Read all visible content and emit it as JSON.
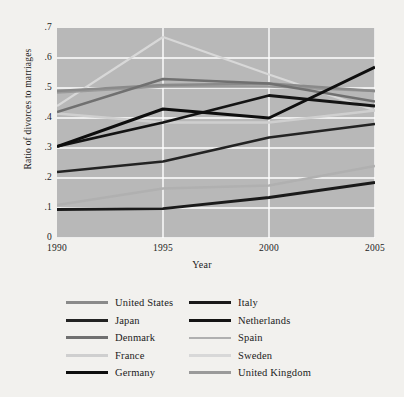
{
  "chart_data": {
    "type": "line",
    "title": "",
    "xlabel": "Year",
    "ylabel": "Ratio of divorces to marriages",
    "x": [
      1990,
      1995,
      2000,
      2005
    ],
    "xticklabels": [
      "1990",
      "1995",
      "2000",
      "2005"
    ],
    "yticklabels": [
      "0",
      ".1",
      ".2",
      ".3",
      ".4",
      ".5",
      ".6",
      ".7"
    ],
    "ytickvalues": [
      0,
      0.1,
      0.2,
      0.3,
      0.4,
      0.5,
      0.6,
      0.7
    ],
    "xlim": [
      1990,
      2005
    ],
    "ylim": [
      0,
      0.7
    ],
    "grid": "white gridlines, horizontal and vertical",
    "legend_position": "below plot, two columns",
    "plot_background": "#b8b8b8",
    "figure_background": "#f2f1ee",
    "gridline_color": "#ffffff",
    "series": [
      {
        "name": "United States",
        "color": "#8a8a8a",
        "width": 2.6,
        "values": [
          0.49,
          0.51,
          0.515,
          0.49
        ]
      },
      {
        "name": "Japan",
        "color": "#232323",
        "width": 2.6,
        "values": [
          0.22,
          0.255,
          0.335,
          0.38
        ]
      },
      {
        "name": "Denmark",
        "color": "#707070",
        "width": 2.6,
        "values": [
          0.42,
          0.53,
          0.515,
          0.455
        ]
      },
      {
        "name": "France",
        "color": "#cfcfcf",
        "width": 2.6,
        "values": [
          0.415,
          0.385,
          0.385,
          0.425
        ]
      },
      {
        "name": "Germany",
        "color": "#0e0e0e",
        "width": 3.0,
        "values": [
          0.305,
          0.43,
          0.4,
          0.57
        ]
      },
      {
        "name": "Italy",
        "color": "#1a1a1a",
        "width": 2.8,
        "values": [
          0.095,
          0.098,
          0.135,
          0.185
        ]
      },
      {
        "name": "Netherlands",
        "color": "#141414",
        "width": 2.8,
        "values": [
          0.305,
          0.385,
          0.475,
          0.44
        ]
      },
      {
        "name": "Spain",
        "color": "#b0b0b0",
        "width": 2.4,
        "values": [
          0.11,
          0.165,
          0.175,
          0.24
        ]
      },
      {
        "name": "Sweden",
        "color": "#d8d8d8",
        "width": 2.2,
        "values": [
          0.44,
          0.67,
          0.545,
          0.425
        ]
      },
      {
        "name": "United Kingdom",
        "color": "#9a9a9a",
        "width": 2.6,
        "values": [
          0.485,
          0.505,
          0.505,
          0.49
        ]
      }
    ]
  },
  "legend": {
    "columns": [
      [
        "United States",
        "Japan",
        "Denmark",
        "France",
        "Germany"
      ],
      [
        "Italy",
        "Netherlands",
        "Spain",
        "Sweden",
        "United Kingdom"
      ]
    ]
  }
}
